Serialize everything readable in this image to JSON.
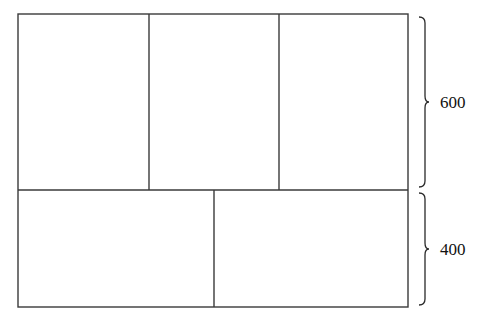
{
  "diagram": {
    "type": "partitioned-rectangle",
    "outer_rect": {
      "x": 18,
      "y": 14,
      "width": 390,
      "height": 293
    },
    "top_row": {
      "height_label": "600",
      "panels": 3
    },
    "bottom_row": {
      "height_label": "400",
      "panels": 2
    },
    "colors": {
      "stroke": "#3a3a3a",
      "background": "#ffffff",
      "text": "#111111"
    }
  },
  "labels": {
    "top_dimension": "600",
    "bottom_dimension": "400"
  }
}
